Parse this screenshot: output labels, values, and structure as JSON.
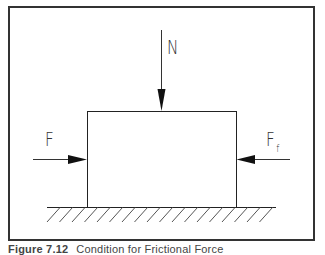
{
  "figure": {
    "caption": {
      "number": "Figure 7.12",
      "text": "Condition for Frictional Force"
    },
    "labels": {
      "normal_force": "N",
      "applied_force": "F",
      "friction_force_main": "F",
      "friction_force_sub": "f"
    },
    "elements": {
      "block": "rectangular block resting on surface",
      "ground": "hatched ground surface",
      "arrows": [
        {
          "name": "N",
          "direction": "down",
          "target": "top of block"
        },
        {
          "name": "F",
          "direction": "right",
          "target": "left side of block"
        },
        {
          "name": "Ff",
          "direction": "left",
          "target": "right side of block"
        }
      ]
    },
    "colors": {
      "frame": "#333333",
      "line": "#222222",
      "hatch": "#555555",
      "background": "#ffffff"
    }
  }
}
